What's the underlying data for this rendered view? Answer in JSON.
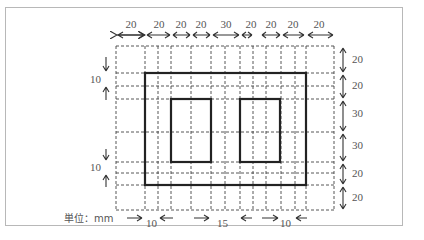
{
  "diagram": {
    "unit_label": "単位：mm",
    "top_dimensions": [
      "20",
      "20",
      "20",
      "20",
      "30",
      "20",
      "20",
      "20",
      "20"
    ],
    "right_dimensions": [
      "20",
      "20",
      "30",
      "30",
      "20",
      "20"
    ],
    "left_dimensions": [
      "10",
      "10"
    ],
    "bottom_dimensions": [
      "10",
      "15",
      "10"
    ],
    "colors": {
      "grid": "#444444",
      "outline": "#222222",
      "text": "#555555",
      "frame": "#b8b8b8"
    }
  }
}
